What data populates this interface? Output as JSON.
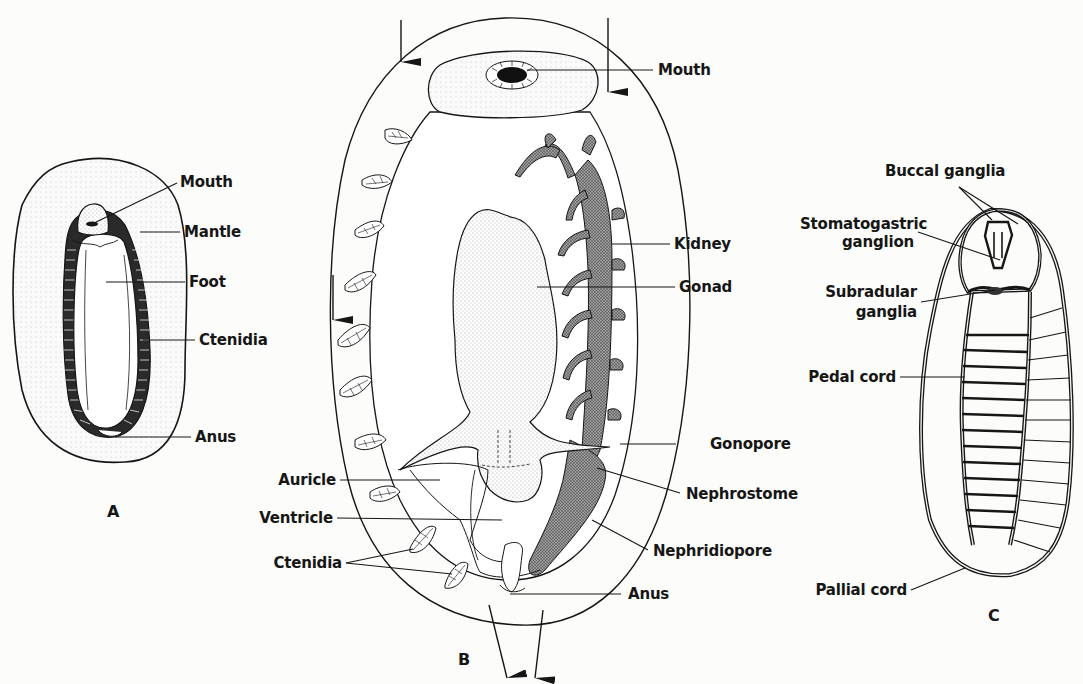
{
  "figures": {
    "A": {
      "letter": "A",
      "labels": {
        "mouth": "Mouth",
        "mantle": "Mantle",
        "foot": "Foot",
        "ctenidia": "Ctenidia",
        "anus": "Anus"
      }
    },
    "B": {
      "letter": "B",
      "labels": {
        "mouth": "Mouth",
        "kidney": "Kidney",
        "gonad": "Gonad",
        "gonopore": "Gonopore",
        "nephrostome": "Nephrostome",
        "nephridiopore": "Nephridiopore",
        "anus": "Anus",
        "auricle": "Auricle",
        "ventricle": "Ventricle",
        "ctenidia": "Ctenidia"
      }
    },
    "C": {
      "letter": "C",
      "labels": {
        "buccal": "Buccal ganglia",
        "stomato1": "Stomatogastric",
        "stomato2": "ganglion",
        "subradular1": "Subradular",
        "subradular2": "ganglia",
        "pedal": "Pedal cord",
        "pallial": "Pallial cord"
      }
    }
  },
  "colors": {
    "ink": "#161616",
    "paper": "#fcfcfa",
    "stipple": "#8a8a8a"
  }
}
